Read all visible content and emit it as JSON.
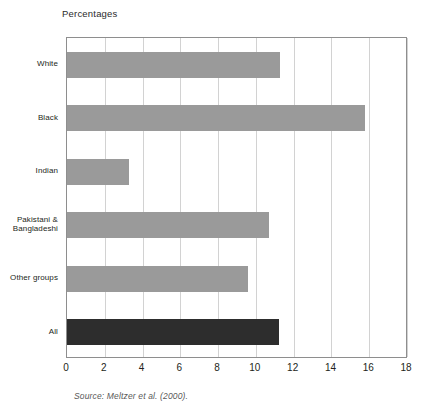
{
  "chart_data": {
    "type": "bar",
    "orientation": "horizontal",
    "title": "Percentages",
    "xlabel": "",
    "ylabel": "",
    "categories": [
      "White",
      "Black",
      "Indian",
      "Pakistani & Bangladeshi",
      "Other groups",
      "All"
    ],
    "values": [
      11.3,
      15.8,
      3.3,
      10.7,
      9.6,
      11.2
    ],
    "series": [
      {
        "name": "Percentages",
        "values": [
          11.3,
          15.8,
          3.3,
          10.7,
          9.6,
          11.2
        ]
      }
    ],
    "xlim": [
      0,
      18
    ],
    "xticks": [
      0,
      2,
      4,
      6,
      8,
      10,
      12,
      14,
      16,
      18
    ],
    "xtick_labels": [
      "0",
      "2",
      "4",
      "6",
      "8",
      "10",
      "12",
      "14",
      "16",
      "18"
    ],
    "grid": true,
    "grid_axis": "x",
    "legend": false,
    "bar_colors": [
      "#9a9a9a",
      "#9a9a9a",
      "#9a9a9a",
      "#9a9a9a",
      "#9a9a9a",
      "#2d2d2d"
    ],
    "highlight_category": "All",
    "annotations": [
      "Source: Meltzer et al. (2000)."
    ]
  },
  "figure": {
    "title": "Percentages",
    "source": "Source: Meltzer et al. (2000).",
    "bar_color": "#9a9a9a",
    "highlight_color": "#2d2d2d",
    "grid_color": "#d2d2d2",
    "axis_color": "#8e8e8e"
  },
  "ylabels": [
    {
      "text": "White"
    },
    {
      "text": "Black"
    },
    {
      "text": "Indian"
    },
    {
      "text": "Pakistani &\nBangladeshi"
    },
    {
      "text": "Other groups"
    },
    {
      "text": "All"
    }
  ],
  "xticks": [
    {
      "label": "0"
    },
    {
      "label": "2"
    },
    {
      "label": "4"
    },
    {
      "label": "6"
    },
    {
      "label": "8"
    },
    {
      "label": "10"
    },
    {
      "label": "12"
    },
    {
      "label": "14"
    },
    {
      "label": "16"
    },
    {
      "label": "18"
    }
  ]
}
